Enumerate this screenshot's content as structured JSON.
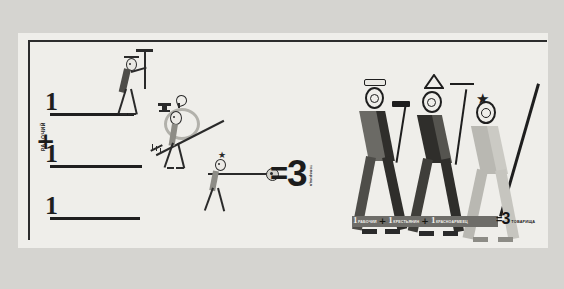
{
  "poster": {
    "title": "1 rabochiy + 1 krestyanin + 1 krasnoarmeyets = 3 tovarishcha",
    "background_color": "#efeeea",
    "scan_margin_color": "#d5d4d0",
    "ink_color": "#1e1e1e",
    "accent_red": "#8f3a33",
    "grey_light": "#b9b8b2",
    "grey_mid": "#8d8c86",
    "grey_dark": "#4e4d49"
  },
  "left_column": {
    "vertical_caption": "РАБОЧИЙ",
    "rows": [
      {
        "numeral": "1",
        "figure_name": "worker-with-hammer",
        "figure_caption": "рабочий",
        "tool": "hammer",
        "head_accessory": "flat-cap",
        "color": "#4e4d49"
      },
      {
        "numeral": "1",
        "figure_name": "peasant-with-rake",
        "figure_caption": "крестьянин",
        "tool": "rake",
        "head_accessory": "sickle-emblem",
        "color": "#8d8c86"
      },
      {
        "numeral": "1",
        "figure_name": "red-army-soldier-with-rifle",
        "figure_caption": "красноармеец",
        "tool": "rifle",
        "head_accessory": "star-budenovka",
        "color": "#8d8c86"
      }
    ],
    "operators": [
      "+",
      "+"
    ]
  },
  "center": {
    "equals": "=",
    "result": "3",
    "result_caption": "товарища"
  },
  "right_column": {
    "figures": [
      {
        "name": "comrade-worker",
        "head_accessory": "flat-cap",
        "tool": "hammer",
        "leg_color": "#4e4d49",
        "body_color": "#6b6a65"
      },
      {
        "name": "comrade-peasant",
        "head_accessory": "pointed-hat",
        "tool": "rake",
        "leg_color": "#3f3e3a",
        "body_color": "#2f2e2b"
      },
      {
        "name": "comrade-soldier",
        "head_accessory": "star-budenovka",
        "tool": "rifle",
        "leg_color": "#b9b8b2",
        "body_color": "#b9b8b2"
      }
    ]
  },
  "equation_bar": {
    "terms": [
      {
        "number": "1",
        "label": "РАБОЧИЙ"
      },
      {
        "number": "1",
        "label": "КРЕСТЬЯНИН"
      },
      {
        "number": "1",
        "label": "КРАСНОАРМЕЕЦ"
      }
    ],
    "separators": [
      "+",
      "+"
    ],
    "equals": "=",
    "result": "3",
    "result_label": "ТОВАРИЩА"
  }
}
